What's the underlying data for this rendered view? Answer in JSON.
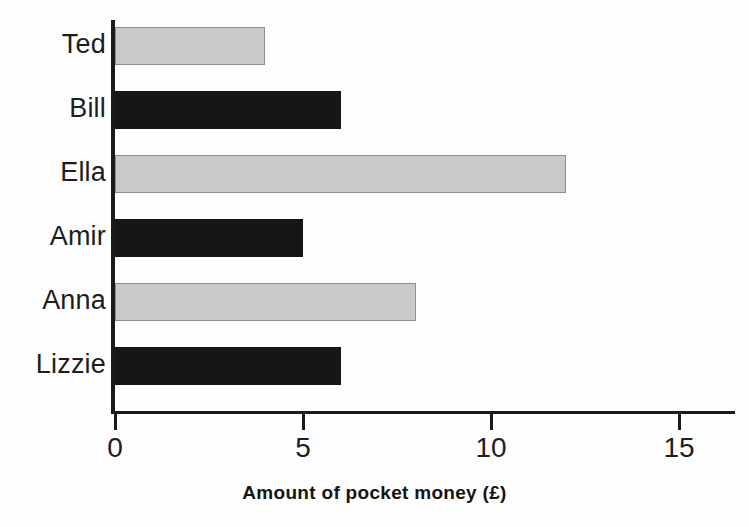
{
  "chart_data": {
    "type": "bar",
    "orientation": "horizontal",
    "title": "",
    "subtitle": "",
    "xlabel": "Amount of pocket money (£)",
    "ylabel": "",
    "categories": [
      "Ted",
      "Bill",
      "Ella",
      "Amir",
      "Anna",
      "Lizzie"
    ],
    "values": [
      4,
      6,
      12,
      5,
      8,
      6
    ],
    "bar_styles": [
      "light",
      "dark",
      "light",
      "dark",
      "light",
      "dark"
    ],
    "series": [
      {
        "name": "Amount of pocket money (£)",
        "values": [
          4,
          6,
          12,
          5,
          8,
          6
        ]
      }
    ],
    "xlim": [
      0,
      16.5
    ],
    "xticks": [
      0,
      5,
      10,
      15
    ],
    "xtick_labels": [
      "0",
      "5",
      "10",
      "15"
    ],
    "grid": false,
    "legend": false,
    "legend_position": "none",
    "annotations": [],
    "colors": {
      "light_bar_fill": "#c9c9c9",
      "light_bar_stroke": "#8e8e8e",
      "dark_bar_fill": "#161616",
      "axis": "#1a1a1a",
      "text": "#1d1d1d",
      "background": "#fdfdfd"
    }
  },
  "axis": {
    "x_title": "Amount of pocket money (£)",
    "ticks": [
      {
        "label": "0",
        "value": 0
      },
      {
        "label": "5",
        "value": 5
      },
      {
        "label": "10",
        "value": 10
      },
      {
        "label": "15",
        "value": 15
      }
    ]
  },
  "bars": [
    {
      "label": "Ted",
      "value": 4,
      "style": "light"
    },
    {
      "label": "Bill",
      "value": 6,
      "style": "dark"
    },
    {
      "label": "Ella",
      "value": 12,
      "style": "light"
    },
    {
      "label": "Amir",
      "value": 5,
      "style": "dark"
    },
    {
      "label": "Anna",
      "value": 8,
      "style": "light"
    },
    {
      "label": "Lizzie",
      "value": 6,
      "style": "dark"
    }
  ]
}
